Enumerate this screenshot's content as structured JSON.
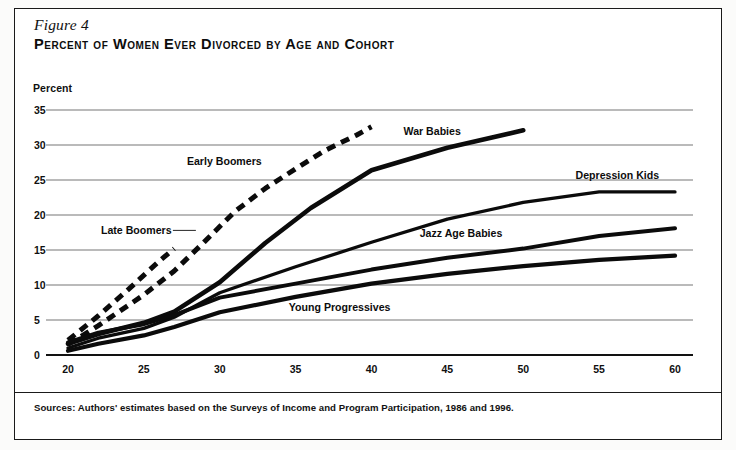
{
  "figure": {
    "number_label": "Figure 4",
    "title": "Percent of Women Ever Divorced by Age and Cohort",
    "source_note": "Sources: Authors' estimates based on the Surveys of Income and Program Participation, 1986 and 1996."
  },
  "chart_data": {
    "type": "line",
    "title": "Percent of Women Ever Divorced by Age and Cohort",
    "xlabel": "",
    "ylabel": "Percent",
    "ylabel_position": "above-axis",
    "xlim": [
      20,
      60
    ],
    "ylim": [
      0,
      35
    ],
    "xticks": [
      20,
      25,
      30,
      35,
      40,
      45,
      50,
      55,
      60
    ],
    "yticks": [
      0,
      5,
      10,
      15,
      20,
      25,
      30,
      35
    ],
    "grid": "horizontal",
    "legend": "inline-annotations",
    "series": [
      {
        "name": "Late Boomers",
        "style": "dashed",
        "x": [
          20,
          22,
          24,
          26,
          27
        ],
        "values": [
          2.1,
          5.6,
          9.4,
          13.4,
          15.2
        ]
      },
      {
        "name": "Early Boomers",
        "style": "dashed",
        "x": [
          20,
          22,
          25,
          27,
          29,
          31,
          33,
          35,
          37,
          39,
          40
        ],
        "values": [
          1.5,
          4.2,
          8.6,
          12.0,
          16.2,
          20.5,
          23.8,
          26.6,
          29.3,
          31.4,
          32.6
        ]
      },
      {
        "name": "War Babies",
        "style": "solid",
        "x": [
          20,
          22,
          25,
          27,
          30,
          33,
          36,
          40,
          45,
          50
        ],
        "values": [
          1.6,
          3.0,
          4.6,
          6.2,
          10.4,
          16.0,
          21.0,
          26.4,
          29.6,
          32.1
        ]
      },
      {
        "name": "Depression Kids",
        "style": "solid",
        "x": [
          20,
          22,
          25,
          27,
          30,
          35,
          40,
          45,
          50,
          55,
          60
        ],
        "values": [
          1.0,
          2.4,
          3.8,
          5.4,
          8.9,
          12.6,
          16.1,
          19.4,
          21.8,
          23.3,
          23.3
        ]
      },
      {
        "name": "Jazz Age Babies",
        "style": "solid",
        "x": [
          20,
          22,
          25,
          27,
          30,
          35,
          40,
          45,
          50,
          55,
          60
        ],
        "values": [
          1.8,
          3.2,
          4.4,
          5.7,
          8.2,
          10.2,
          12.2,
          13.9,
          15.2,
          17.0,
          18.1
        ]
      },
      {
        "name": "Young Progressives",
        "style": "solid",
        "x": [
          20,
          22,
          25,
          27,
          30,
          35,
          40,
          45,
          50,
          55,
          60
        ],
        "values": [
          0.6,
          1.6,
          2.8,
          4.0,
          6.1,
          8.3,
          10.2,
          11.6,
          12.7,
          13.6,
          14.2
        ]
      }
    ],
    "annotations": [
      {
        "text": "War Babies",
        "x": 44.0,
        "y": 31.4,
        "anchor": "middle",
        "leader": false
      },
      {
        "text": "Early Boomers",
        "x": 30.3,
        "y": 27.2,
        "anchor": "middle",
        "leader": false
      },
      {
        "text": "Depression Kids",
        "x": 56.2,
        "y": 25.2,
        "anchor": "middle",
        "leader": false
      },
      {
        "text": "Late Boomers",
        "x": 24.5,
        "y": 17.3,
        "anchor": "middle",
        "leader": true
      },
      {
        "text": "Jazz Age Babies",
        "x": 45.9,
        "y": 16.8,
        "anchor": "middle",
        "leader": false
      },
      {
        "text": "Young Progressives",
        "x": 37.9,
        "y": 6.3,
        "anchor": "middle",
        "leader": false
      }
    ]
  }
}
